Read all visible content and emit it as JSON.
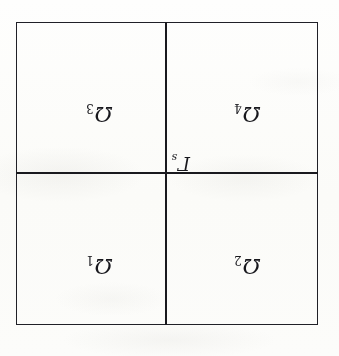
{
  "figure": {
    "kind": "domain-decomposition-diagram",
    "orientation_note": "upside-down-scan",
    "rotation_degrees": 180,
    "background_color": "#fdfdfb",
    "ink_color": "#1d1d22",
    "outer_boundary": {
      "shape": "square",
      "x": 21,
      "y": 31,
      "width": 302,
      "height": 303,
      "stroke_width": 1.6
    },
    "dividers": [
      {
        "name": "vertical-divider",
        "orientation": "vertical",
        "position": 172,
        "stroke_width": 2.1
      },
      {
        "name": "horizontal-divider",
        "orientation": "horizontal",
        "position": 182,
        "stroke_width": 2.1
      }
    ],
    "regions": [
      {
        "id": "omega-1",
        "symbol": "Ω",
        "subscript": "1",
        "quadrant_in_figure": "top-right",
        "quadrant_on_screen": "bottom-left"
      },
      {
        "id": "omega-2",
        "symbol": "Ω",
        "subscript": "2",
        "quadrant_in_figure": "top-left",
        "quadrant_on_screen": "bottom-right"
      },
      {
        "id": "omega-3",
        "symbol": "Ω",
        "subscript": "3",
        "quadrant_in_figure": "bottom-right",
        "quadrant_on_screen": "top-left"
      },
      {
        "id": "omega-4",
        "symbol": "Ω",
        "subscript": "4",
        "quadrant_in_figure": "bottom-left",
        "quadrant_on_screen": "top-right"
      }
    ],
    "interface": {
      "id": "gamma-s",
      "symbol": "Γ",
      "subscript": "s"
    }
  }
}
